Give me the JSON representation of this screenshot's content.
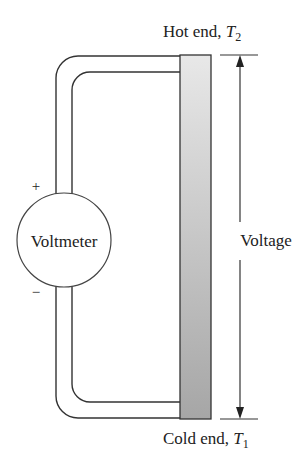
{
  "diagram": {
    "type": "thermocouple-circuit",
    "labels": {
      "hot_end": "Hot end, ",
      "hot_var": "T",
      "hot_sub": "2",
      "cold_end": "Cold end, ",
      "cold_var": "T",
      "cold_sub": "1",
      "voltmeter": "Voltmeter",
      "voltage": "Voltage",
      "plus": "+",
      "minus": "−"
    },
    "colors": {
      "line": "#333333",
      "bar_top": "#e6e6e6",
      "bar_bottom": "#a8a8a8",
      "background": "#ffffff"
    }
  }
}
